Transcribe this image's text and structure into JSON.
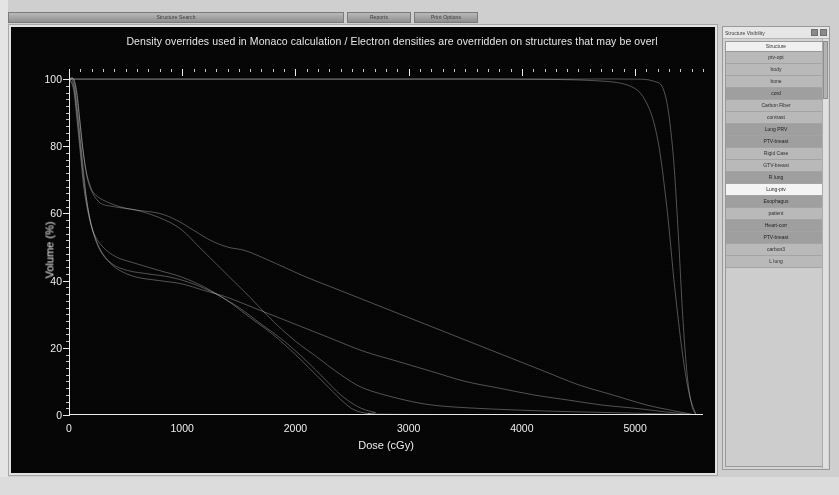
{
  "toolbar": {
    "buttons": [
      {
        "name": "structure-search",
        "label": "Structure Search",
        "width": "wide"
      },
      {
        "name": "reports",
        "label": "Reports",
        "width": "mid"
      },
      {
        "name": "print-options",
        "label": "Print Options",
        "width": "mid"
      }
    ]
  },
  "chart_data": {
    "type": "line",
    "title": "Density overrides used in Monaco calculation / Electron densities are overridden on structures that may be overl",
    "xlabel": "Dose (cGy)",
    "ylabel": "Volume (%)",
    "xlim": [
      0,
      5600
    ],
    "ylim": [
      0,
      103
    ],
    "xticks": [
      0,
      1000,
      2000,
      3000,
      4000,
      5000
    ],
    "yticks": [
      0,
      20,
      40,
      60,
      80,
      100
    ],
    "grid": false,
    "legend_position": "none",
    "line_color": "#e6e6e6",
    "series": [
      {
        "name": "PTV",
        "points": [
          [
            0,
            100
          ],
          [
            500,
            100
          ],
          [
            1500,
            100
          ],
          [
            2500,
            100
          ],
          [
            3500,
            100
          ],
          [
            4400,
            100
          ],
          [
            4900,
            100
          ],
          [
            5150,
            99.5
          ],
          [
            5260,
            96
          ],
          [
            5330,
            80
          ],
          [
            5380,
            55
          ],
          [
            5420,
            30
          ],
          [
            5460,
            12
          ],
          [
            5500,
            3
          ],
          [
            5540,
            0
          ]
        ]
      },
      {
        "name": "Target",
        "points": [
          [
            0,
            100
          ],
          [
            800,
            100
          ],
          [
            1800,
            100
          ],
          [
            2800,
            100
          ],
          [
            3800,
            100
          ],
          [
            4600,
            99.6
          ],
          [
            4950,
            98
          ],
          [
            5100,
            93
          ],
          [
            5200,
            82
          ],
          [
            5280,
            62
          ],
          [
            5350,
            38
          ],
          [
            5420,
            18
          ],
          [
            5480,
            6
          ],
          [
            5540,
            0
          ]
        ]
      },
      {
        "name": "L lung",
        "points": [
          [
            0,
            100
          ],
          [
            40,
            100
          ],
          [
            70,
            96
          ],
          [
            95,
            88
          ],
          [
            120,
            80
          ],
          [
            150,
            73
          ],
          [
            180,
            69
          ],
          [
            220,
            66
          ],
          [
            300,
            64
          ],
          [
            450,
            62
          ],
          [
            650,
            60.5
          ],
          [
            850,
            58
          ],
          [
            1000,
            55
          ],
          [
            1150,
            50
          ],
          [
            1300,
            45
          ],
          [
            1450,
            40
          ],
          [
            1600,
            35
          ],
          [
            1800,
            28
          ],
          [
            2000,
            22
          ],
          [
            2200,
            17
          ],
          [
            2400,
            12
          ],
          [
            2600,
            8
          ],
          [
            2900,
            5
          ],
          [
            3200,
            3
          ],
          [
            3600,
            2
          ],
          [
            4200,
            1.2
          ],
          [
            4800,
            0.7
          ],
          [
            5300,
            0.3
          ],
          [
            5540,
            0
          ]
        ]
      },
      {
        "name": "R lung",
        "points": [
          [
            0,
            100
          ],
          [
            40,
            100
          ],
          [
            70,
            95
          ],
          [
            100,
            86
          ],
          [
            130,
            77
          ],
          [
            165,
            70
          ],
          [
            210,
            66
          ],
          [
            280,
            63
          ],
          [
            400,
            62
          ],
          [
            600,
            61
          ],
          [
            800,
            60
          ],
          [
            950,
            58
          ],
          [
            1100,
            55
          ],
          [
            1250,
            52
          ],
          [
            1400,
            50
          ],
          [
            1550,
            49
          ],
          [
            1700,
            47
          ],
          [
            1900,
            44
          ],
          [
            2100,
            41
          ],
          [
            2400,
            37
          ],
          [
            2700,
            33
          ],
          [
            3000,
            29
          ],
          [
            3300,
            25
          ],
          [
            3600,
            21
          ],
          [
            3900,
            17
          ],
          [
            4200,
            13
          ],
          [
            4500,
            9
          ],
          [
            4800,
            6
          ],
          [
            5100,
            3
          ],
          [
            5350,
            1.2
          ],
          [
            5540,
            0
          ]
        ]
      },
      {
        "name": "Esophagus",
        "points": [
          [
            0,
            100
          ],
          [
            40,
            99
          ],
          [
            70,
            92
          ],
          [
            100,
            82
          ],
          [
            130,
            72
          ],
          [
            160,
            63
          ],
          [
            200,
            56
          ],
          [
            260,
            50
          ],
          [
            340,
            46
          ],
          [
            450,
            43
          ],
          [
            600,
            41
          ],
          [
            800,
            40
          ],
          [
            1000,
            39
          ],
          [
            1200,
            37
          ],
          [
            1400,
            35
          ],
          [
            1700,
            31
          ],
          [
            2000,
            27
          ],
          [
            2300,
            23
          ],
          [
            2600,
            19
          ],
          [
            2900,
            16
          ],
          [
            3200,
            13
          ],
          [
            3500,
            10
          ],
          [
            3800,
            8
          ],
          [
            4100,
            6
          ],
          [
            4400,
            4.5
          ],
          [
            4700,
            3
          ],
          [
            5000,
            2
          ],
          [
            5250,
            1
          ],
          [
            5540,
            0
          ]
        ]
      },
      {
        "name": "cord",
        "points": [
          [
            0,
            100
          ],
          [
            40,
            98
          ],
          [
            70,
            90
          ],
          [
            100,
            80
          ],
          [
            130,
            70
          ],
          [
            165,
            62
          ],
          [
            210,
            55
          ],
          [
            280,
            49
          ],
          [
            380,
            45
          ],
          [
            520,
            43
          ],
          [
            700,
            42
          ],
          [
            900,
            41
          ],
          [
            1100,
            39
          ],
          [
            1300,
            36
          ],
          [
            1500,
            32
          ],
          [
            1700,
            27
          ],
          [
            1900,
            22
          ],
          [
            2100,
            16
          ],
          [
            2250,
            11
          ],
          [
            2400,
            6
          ],
          [
            2550,
            2.5
          ],
          [
            2700,
            0.8
          ],
          [
            2900,
            0.2
          ],
          [
            5540,
            0
          ]
        ]
      },
      {
        "name": "Body",
        "points": [
          [
            0,
            100
          ],
          [
            40,
            97
          ],
          [
            70,
            88
          ],
          [
            100,
            78
          ],
          [
            130,
            68
          ],
          [
            170,
            60
          ],
          [
            220,
            54
          ],
          [
            300,
            50
          ],
          [
            420,
            47
          ],
          [
            600,
            45
          ],
          [
            800,
            43
          ],
          [
            1000,
            41
          ],
          [
            1200,
            38
          ],
          [
            1400,
            34
          ],
          [
            1600,
            29
          ],
          [
            1800,
            24
          ],
          [
            2000,
            18
          ],
          [
            2150,
            13
          ],
          [
            2300,
            8
          ],
          [
            2420,
            4
          ],
          [
            2520,
            1.5
          ],
          [
            2650,
            0.4
          ],
          [
            2850,
            0
          ],
          [
            5540,
            0
          ]
        ]
      }
    ]
  },
  "structure_panel": {
    "title": "Structure Visibility",
    "minimize_label": "",
    "close_label": "",
    "column_header": "Structure",
    "rows": [
      {
        "label": "ptv-opt",
        "style": "normal"
      },
      {
        "label": "body",
        "style": "normal"
      },
      {
        "label": "bone",
        "style": "normal"
      },
      {
        "label": "cord",
        "style": "alt"
      },
      {
        "label": "Carbon Fiber",
        "style": "normal"
      },
      {
        "label": "contrast",
        "style": "normal"
      },
      {
        "label": "Lung PRV",
        "style": "alt"
      },
      {
        "label": "PTV-breast",
        "style": "alt"
      },
      {
        "label": "Rigid Case",
        "style": "normal"
      },
      {
        "label": "GTV-breast",
        "style": "normal"
      },
      {
        "label": "R lung",
        "style": "alt"
      },
      {
        "label": "Lung-ptv",
        "style": "sel"
      },
      {
        "label": "Esophagus",
        "style": "alt"
      },
      {
        "label": "patient",
        "style": "normal"
      },
      {
        "label": "Heart-corr",
        "style": "alt"
      },
      {
        "label": "PTV-breast",
        "style": "alt"
      },
      {
        "label": "carbon3",
        "style": "normal"
      },
      {
        "label": "L lung",
        "style": "normal"
      }
    ]
  }
}
